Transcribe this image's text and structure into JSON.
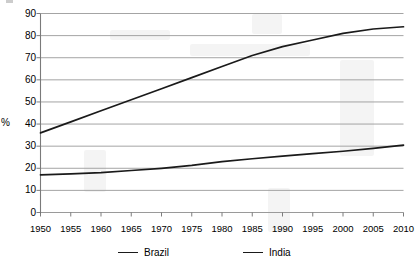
{
  "chart_data": {
    "type": "line",
    "title": "",
    "subtitle": "",
    "xlabel": "",
    "ylabel": "%",
    "x": [
      1950,
      1955,
      1960,
      1965,
      1970,
      1975,
      1980,
      1985,
      1990,
      1995,
      2000,
      2005,
      2010
    ],
    "xtick_labels": [
      "1950",
      "1955",
      "1960",
      "1965",
      "1970",
      "1975",
      "1980",
      "1985",
      "1990",
      "1995",
      "2000",
      "2005",
      "2010"
    ],
    "ytick_labels": [
      "90",
      "80",
      "70",
      "60",
      "50",
      "40",
      "30",
      "20",
      "10",
      "0"
    ],
    "yticks": [
      90,
      80,
      70,
      60,
      50,
      40,
      30,
      20,
      10,
      0
    ],
    "ylim": [
      0,
      90
    ],
    "xlim": [
      1950,
      2010
    ],
    "grid": "horizontal",
    "legend_position": "bottom",
    "series": [
      {
        "name": "Brazil",
        "color": "#1a1a1a",
        "values": [
          36,
          41,
          46,
          51,
          56,
          61,
          66,
          71,
          75,
          78,
          81,
          83,
          84
        ]
      },
      {
        "name": "India",
        "color": "#1a1a1a",
        "values": [
          17,
          17.5,
          18,
          19,
          20,
          21.3,
          23,
          24.3,
          25.5,
          26.6,
          27.7,
          29,
          30.5
        ]
      }
    ]
  },
  "axis": {
    "y_axis_label": "%"
  },
  "legend": {
    "items": [
      {
        "label": "Brazil"
      },
      {
        "label": "India"
      }
    ]
  }
}
